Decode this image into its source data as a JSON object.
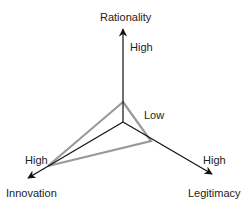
{
  "diagram": {
    "axes": [
      {
        "id": "rationality",
        "label": "Rationality",
        "end_label": "High"
      },
      {
        "id": "innovation",
        "label": "Innovation",
        "end_label": "High"
      },
      {
        "id": "legitimacy",
        "label": "Legitimacy",
        "end_label": "High"
      }
    ],
    "center_label": "Low",
    "colors": {
      "axis": "#111111",
      "profile": "#999999"
    }
  }
}
